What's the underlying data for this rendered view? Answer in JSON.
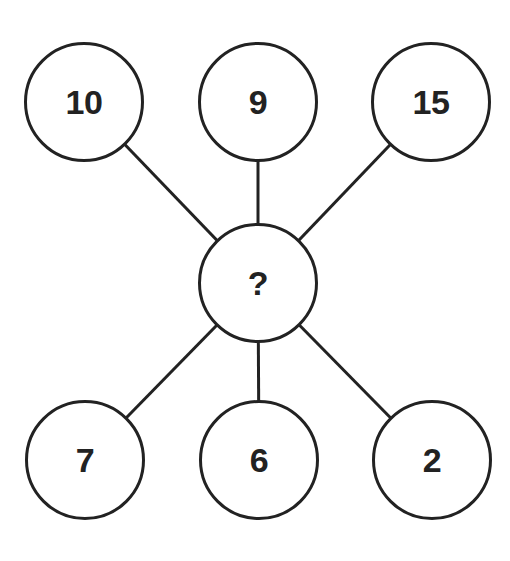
{
  "diagram": {
    "type": "number-puzzle-star",
    "colors": {
      "stroke": "#222222",
      "background": "#ffffff",
      "text": "#222222"
    },
    "center": {
      "label": "?",
      "cx": 258,
      "cy": 283
    },
    "nodes": [
      {
        "label": "10",
        "cx": 84,
        "cy": 102
      },
      {
        "label": "9",
        "cx": 258,
        "cy": 102
      },
      {
        "label": "15",
        "cx": 431,
        "cy": 102
      },
      {
        "label": "7",
        "cx": 85,
        "cy": 460
      },
      {
        "label": "6",
        "cx": 259,
        "cy": 460
      },
      {
        "label": "2",
        "cx": 432,
        "cy": 460
      }
    ],
    "edges": [
      {
        "from": "center",
        "to": "10"
      },
      {
        "from": "center",
        "to": "9"
      },
      {
        "from": "center",
        "to": "15"
      },
      {
        "from": "center",
        "to": "7"
      },
      {
        "from": "center",
        "to": "6"
      },
      {
        "from": "center",
        "to": "2"
      }
    ]
  }
}
